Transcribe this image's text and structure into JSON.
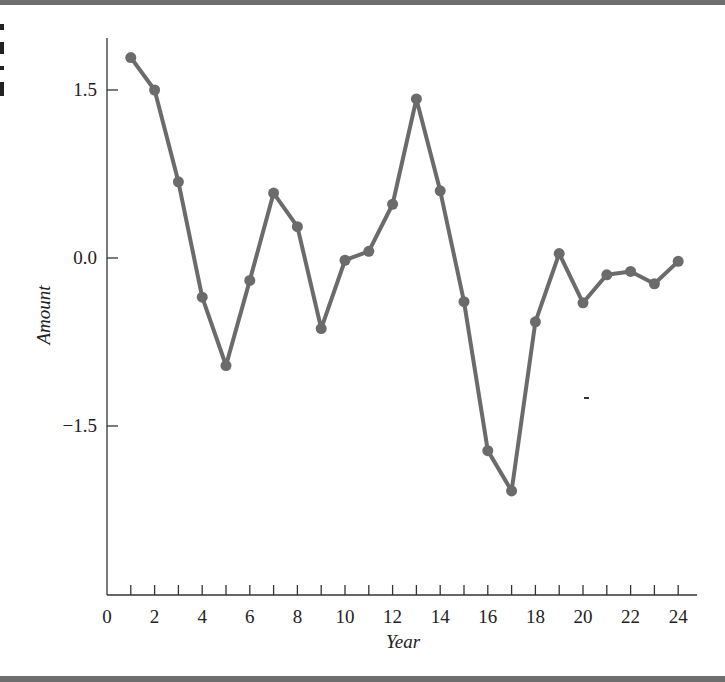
{
  "chart_data": {
    "type": "line",
    "title": "",
    "xlabel": "Year",
    "ylabel": "Amount",
    "x": [
      1,
      2,
      3,
      4,
      5,
      6,
      7,
      8,
      9,
      10,
      11,
      12,
      13,
      14,
      15,
      16,
      17,
      18,
      19,
      20,
      21,
      22,
      23,
      24
    ],
    "series": [
      {
        "name": "Amount",
        "values": [
          1.79,
          1.5,
          0.68,
          -0.35,
          -0.96,
          -0.2,
          0.58,
          0.28,
          -0.63,
          -0.02,
          0.06,
          0.48,
          1.42,
          0.6,
          -0.39,
          -1.72,
          -2.08,
          -0.57,
          0.04,
          -0.4,
          -0.15,
          -0.12,
          -0.23,
          -0.03
        ]
      }
    ],
    "xlim": [
      0,
      25
    ],
    "ylim": [
      -3.0,
      1.95
    ],
    "x_tick_labels": [
      "0",
      "2",
      "4",
      "6",
      "8",
      "10",
      "12",
      "14",
      "16",
      "18",
      "20",
      "22",
      "24"
    ],
    "x_ticks_minor_every": 1,
    "y_tick_labels": [
      "1.5",
      "0.0",
      "−1.5"
    ],
    "y_ticks": [
      1.5,
      0.0,
      -1.5
    ],
    "grid": false,
    "legend": null,
    "line_color": "#6b6b6b",
    "marker": "filled-circle"
  }
}
